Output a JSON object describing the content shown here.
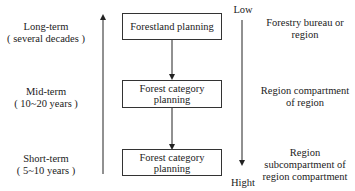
{
  "left_labels": [
    {
      "term": "Long-term",
      "span": "( several decades )"
    },
    {
      "term": "Mid-term",
      "span": "( 10~20 years )"
    },
    {
      "term": "Short-term",
      "span": "( 5~10 years )"
    }
  ],
  "boxes": [
    {
      "line1": "Forestland planning",
      "line2": ""
    },
    {
      "line1": "Forest category",
      "line2": "planning"
    },
    {
      "line1": "Forest category",
      "line2": "planning"
    }
  ],
  "scale": {
    "top": "Low",
    "bottom": "Hight"
  },
  "right_labels": [
    {
      "line1": "Forestry bureau or",
      "line2": "region",
      "line3": ""
    },
    {
      "line1": "Region compartment",
      "line2": "of region",
      "line3": ""
    },
    {
      "line1": "Region",
      "line2": "subcompartment of",
      "line3": "region compartment"
    }
  ]
}
